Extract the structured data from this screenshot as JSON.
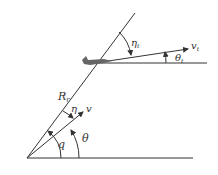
{
  "diagram": {
    "type": "pursuit-guidance-geometry",
    "labels": {
      "line_of_sight": "R",
      "line_of_sight_sub": "r",
      "pursuer_velocity": "v",
      "target_velocity": "v",
      "target_velocity_sub": "t",
      "flight_path_angle": "θ",
      "target_flight_path_angle": "θ",
      "target_flight_path_angle_sub": "t",
      "lead_angle": "η",
      "target_lead_angle": "η",
      "target_lead_angle_sub": "t",
      "los_angle": "q"
    },
    "colors": {
      "line": "#333333",
      "background": "#ffffff",
      "aircraft": "#666666"
    }
  }
}
